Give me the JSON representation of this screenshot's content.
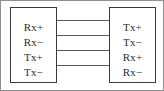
{
  "figure": {
    "width": 164,
    "height": 91,
    "background_color": "#ffffff",
    "border_color": "#8f8f8f",
    "box_border_color": "#3a3a3a",
    "line_color": "#585858",
    "text_color": "#2b2b2b"
  },
  "left_box": {
    "name": "left-connector",
    "ports": [
      {
        "label": "Rx+"
      },
      {
        "label": "Rx−"
      },
      {
        "label": "Tx+"
      },
      {
        "label": "Tx−"
      }
    ]
  },
  "right_box": {
    "name": "right-connector",
    "ports": [
      {
        "label": "Tx+"
      },
      {
        "label": "Tx−"
      },
      {
        "label": "Rx+"
      },
      {
        "label": "Rx−"
      }
    ]
  },
  "connections": [
    {
      "from": "Rx+",
      "to": "Tx+"
    },
    {
      "from": "Rx−",
      "to": "Tx−"
    },
    {
      "from": "Tx+",
      "to": "Rx+"
    },
    {
      "from": "Tx−",
      "to": "Rx−"
    }
  ]
}
